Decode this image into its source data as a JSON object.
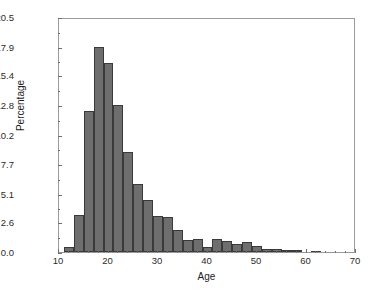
{
  "chart_data": {
    "type": "bar",
    "title": "",
    "xlabel": "Age",
    "ylabel": "Percentage",
    "xlim": [
      10,
      70
    ],
    "ylim": [
      0.0,
      20.5
    ],
    "grid": false,
    "legend": null,
    "bin_width": 2,
    "xticks": [
      10,
      20,
      30,
      40,
      50,
      60,
      70
    ],
    "xtick_labels": [
      "10",
      "20",
      "30",
      "40",
      "50",
      "60",
      "70"
    ],
    "yticks": [
      0.0,
      2.6,
      5.1,
      7.7,
      10.2,
      12.8,
      15.4,
      17.9,
      20.5
    ],
    "ytick_labels": [
      "0.0",
      "2.6",
      "5.1",
      "7.7",
      "10.2",
      "12.8",
      "15.4",
      "17.9",
      "20.5"
    ],
    "bar_color": "#6e6e6e",
    "bar_edge_color": "#3a3a3a",
    "bin_starts": [
      11,
      13,
      15,
      17,
      19,
      21,
      23,
      25,
      27,
      29,
      31,
      33,
      35,
      37,
      39,
      41,
      43,
      45,
      47,
      49,
      51,
      53,
      55,
      57,
      59,
      61
    ],
    "values": [
      0.45,
      3.2,
      12.3,
      17.9,
      16.5,
      12.85,
      8.7,
      5.9,
      4.5,
      3.15,
      3.05,
      1.95,
      1.05,
      1.15,
      0.45,
      1.15,
      0.95,
      0.7,
      0.9,
      0.55,
      0.25,
      0.25,
      0.2,
      0.2,
      0.0,
      0.05
    ],
    "categories": [
      "11-13",
      "13-15",
      "15-17",
      "17-19",
      "19-21",
      "21-23",
      "23-25",
      "25-27",
      "27-29",
      "29-31",
      "31-33",
      "33-35",
      "35-37",
      "37-39",
      "39-41",
      "41-43",
      "43-45",
      "45-47",
      "47-49",
      "49-51",
      "51-53",
      "53-55",
      "55-57",
      "57-59",
      "59-61",
      "61-63"
    ]
  }
}
